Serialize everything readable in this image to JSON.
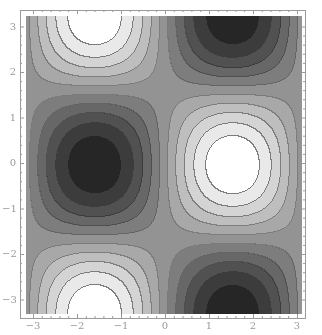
{
  "chart_data": {
    "type": "heatmap",
    "subtype": "contour",
    "title": "",
    "xlabel": "",
    "ylabel": "",
    "function": "sin(x)*cos(y)",
    "xlim": [
      -3.1416,
      3.1416
    ],
    "ylim": [
      -3.1416,
      3.1416
    ],
    "x_ticks": [
      -3,
      -2,
      -1,
      0,
      1,
      2,
      3
    ],
    "y_ticks": [
      -3,
      -2,
      -1,
      0,
      1,
      2,
      3
    ],
    "x_tick_labels": [
      "-3",
      "-2",
      "-1",
      "0",
      "1",
      "2",
      "3"
    ],
    "y_tick_labels": [
      "-3",
      "-2",
      "-1",
      "0",
      "1",
      "2",
      "3"
    ],
    "contour_levels": 10,
    "colormap": "grayscale",
    "color_min": "#1e1e1e",
    "color_max": "#ffffff",
    "contour_line_color": "#6a6a6a",
    "extrema": [
      {
        "x": 1.5708,
        "y": 0,
        "type": "max",
        "value": 1
      },
      {
        "x": -1.5708,
        "y": 0,
        "type": "min",
        "value": -1
      },
      {
        "x": -1.5708,
        "y": 3.1416,
        "type": "max",
        "value": 1
      },
      {
        "x": -1.5708,
        "y": -3.1416,
        "type": "max",
        "value": 1
      },
      {
        "x": 1.5708,
        "y": 3.1416,
        "type": "min",
        "value": -1
      },
      {
        "x": 1.5708,
        "y": -3.1416,
        "type": "min",
        "value": -1
      }
    ],
    "grid": false,
    "legend": null,
    "frame": true
  },
  "layout": {
    "plot_px": {
      "left": 26,
      "top": 16,
      "width": 276,
      "height": 298
    },
    "x_zero_px": 165,
    "y_zero_px": 163,
    "px_per_unit_x": 44,
    "px_per_unit_y": 45.5
  }
}
